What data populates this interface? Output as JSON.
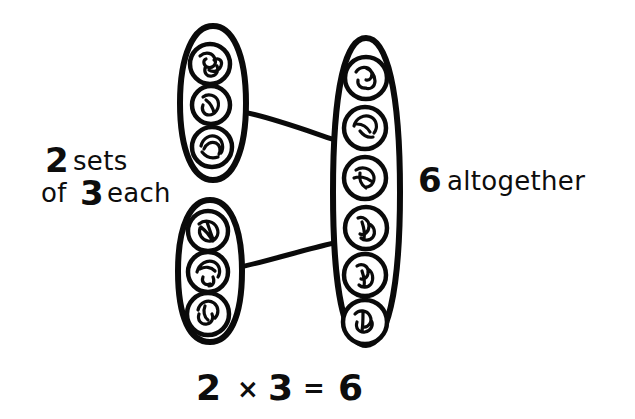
{
  "page": {
    "background_color": "#ffffff",
    "ink_color": "#0a0a0a",
    "width": 635,
    "height": 419
  },
  "labels": {
    "left_line1_number": "2",
    "left_line1_word": "sets",
    "left_line2_word_before": "of",
    "left_line2_number": "3",
    "left_line2_word_after": "each",
    "right_number": "6",
    "right_word": "altogether"
  },
  "equation": {
    "left_operand": "2",
    "operator": "×",
    "right_operand": "3",
    "equals": "=",
    "result": "6",
    "full": "2 × 3 = 6"
  },
  "groups": [
    {
      "id": "set-1",
      "name": "top-left-set",
      "item_count": 3,
      "position": "top-left",
      "cx": 213,
      "cy": 103,
      "rx": 32,
      "ry": 77,
      "items": [
        "item-a",
        "item-b",
        "item-c"
      ]
    },
    {
      "id": "set-2",
      "name": "bottom-left-set",
      "item_count": 3,
      "position": "bottom-left",
      "cx": 210,
      "cy": 271,
      "rx": 32,
      "ry": 71,
      "items": [
        "item-d",
        "item-e",
        "item-f"
      ]
    },
    {
      "id": "total-set",
      "name": "right-total-set",
      "item_count": 6,
      "position": "right",
      "cx": 366,
      "cy": 192,
      "rx": 34,
      "ry": 154,
      "items": [
        "item-1",
        "item-2",
        "item-3",
        "item-4",
        "item-5",
        "item-6"
      ]
    }
  ],
  "connectors": [
    {
      "id": "connector-1",
      "from": "set-1",
      "to": "total-set",
      "x1": 243,
      "y1": 113,
      "x2": 334,
      "y2": 140
    },
    {
      "id": "connector-2",
      "from": "set-2",
      "to": "total-set",
      "x1": 240,
      "y1": 266,
      "x2": 333,
      "y2": 243
    }
  ],
  "items_left_top": [
    {
      "id": "item-a",
      "cx": 210,
      "cy": 64,
      "r": 20
    },
    {
      "id": "item-b",
      "cx": 211,
      "cy": 105,
      "r": 19
    },
    {
      "id": "item-c",
      "cx": 212,
      "cy": 147,
      "r": 20
    }
  ],
  "items_left_bottom": [
    {
      "id": "item-d",
      "cx": 208,
      "cy": 231,
      "r": 20
    },
    {
      "id": "item-e",
      "cx": 208,
      "cy": 272,
      "r": 20
    },
    {
      "id": "item-f",
      "cx": 208,
      "cy": 314,
      "r": 21
    }
  ],
  "items_right": [
    {
      "id": "item-1",
      "cx": 366,
      "cy": 78,
      "r": 21
    },
    {
      "id": "item-2",
      "cx": 365,
      "cy": 128,
      "r": 21
    },
    {
      "id": "item-3",
      "cx": 365,
      "cy": 178,
      "r": 21
    },
    {
      "id": "item-4",
      "cx": 366,
      "cy": 228,
      "r": 21
    },
    {
      "id": "item-5",
      "cx": 365,
      "cy": 275,
      "r": 21
    },
    {
      "id": "item-6",
      "cx": 365,
      "cy": 322,
      "r": 22
    }
  ]
}
